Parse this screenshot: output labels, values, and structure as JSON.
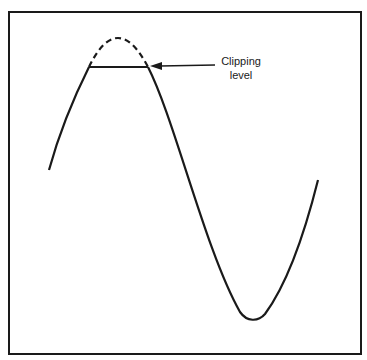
{
  "diagram": {
    "type": "clipped-sine-wave",
    "annotation": {
      "line1": "Clipping",
      "line2": "level"
    },
    "colors": {
      "stroke": "#1a1a1a",
      "background": "#ffffff"
    }
  }
}
